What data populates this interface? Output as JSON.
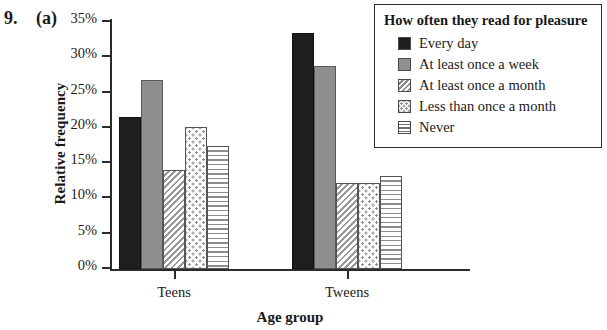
{
  "figure": {
    "number": "9.",
    "part": "(a)"
  },
  "chart_data": {
    "type": "bar",
    "title": "",
    "xlabel": "Age group",
    "ylabel": "Relative frequency",
    "categories": [
      "Teens",
      "Tweens"
    ],
    "legend_title": "How often they read for pleasure",
    "legend_position": "top-right",
    "grid": false,
    "ylim": [
      0,
      35
    ],
    "ytick_labels": [
      "35%",
      "30%",
      "25%",
      "20%",
      "15%",
      "10%",
      "5%",
      "0%"
    ],
    "ytick_values": [
      35,
      30,
      25,
      20,
      15,
      10,
      5,
      0
    ],
    "series": [
      {
        "name": "Every day",
        "pattern": "solid-black",
        "values": [
          21.5,
          33.5
        ]
      },
      {
        "name": "At least once a week",
        "pattern": "solid-gray",
        "values": [
          26.8,
          28.7
        ]
      },
      {
        "name": "At least once a month",
        "pattern": "diagonal-stripe",
        "values": [
          14.1,
          12.2
        ]
      },
      {
        "name": "Less than once a month",
        "pattern": "dotted",
        "values": [
          20.1,
          12.2
        ]
      },
      {
        "name": "Never",
        "pattern": "horizontal-stripe",
        "values": [
          17.4,
          13.2
        ]
      }
    ]
  }
}
